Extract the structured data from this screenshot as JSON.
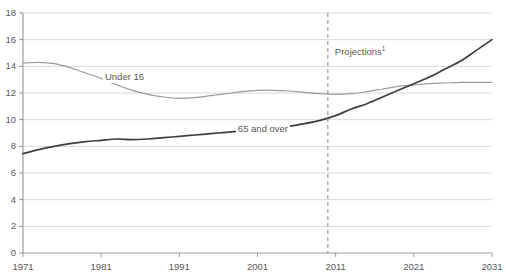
{
  "chart_data": {
    "type": "line",
    "title": "",
    "subtitle": "",
    "xlabel": "",
    "ylabel": "",
    "units": "Millions",
    "xlim": [
      1971,
      2031
    ],
    "ylim": [
      0,
      18
    ],
    "grid": true,
    "grid_axis": "y",
    "legend": "inline-labels",
    "y_ticks": [
      0,
      2,
      4,
      6,
      8,
      10,
      12,
      14,
      16,
      18
    ],
    "y_tick_labels": [
      "0",
      "2",
      "4",
      "6",
      "8",
      "10",
      "12",
      "14",
      "16",
      "18"
    ],
    "x_ticks": [
      1971,
      1981,
      1991,
      2001,
      2011,
      2021,
      2031
    ],
    "x_tick_labels": [
      "1971",
      "1981",
      "1991",
      "2001",
      "2011",
      "2021",
      "2031"
    ],
    "annotations": [
      {
        "name": "projections-divider",
        "label": "Projections",
        "superscript": "1",
        "x": 2010,
        "style": "dashed-vertical-line"
      }
    ],
    "series": [
      {
        "name": "Under 16",
        "color": "#9a9a9a",
        "label_x": 1982,
        "label_y": 13.1,
        "x": [
          1971,
          1973,
          1975,
          1977,
          1979,
          1981,
          1983,
          1985,
          1987,
          1989,
          1991,
          1993,
          1995,
          1997,
          1999,
          2001,
          2003,
          2005,
          2007,
          2009,
          2011,
          2013,
          2015,
          2017,
          2019,
          2021,
          2023,
          2025,
          2027,
          2029,
          2031
        ],
        "values": [
          14.25,
          14.3,
          14.2,
          13.9,
          13.5,
          13.1,
          12.6,
          12.2,
          11.9,
          11.7,
          11.6,
          11.65,
          11.8,
          11.95,
          12.1,
          12.2,
          12.2,
          12.15,
          12.05,
          11.95,
          11.9,
          11.95,
          12.1,
          12.3,
          12.5,
          12.6,
          12.7,
          12.75,
          12.8,
          12.8,
          12.8
        ]
      },
      {
        "name": "65 and over",
        "color": "#3f3f3f",
        "label_x": 1999,
        "label_y": 9.2,
        "x": [
          1971,
          1973,
          1975,
          1977,
          1979,
          1981,
          1983,
          1985,
          1987,
          1989,
          1991,
          1993,
          1995,
          1997,
          1999,
          2001,
          2003,
          2005,
          2007,
          2009,
          2011,
          2013,
          2015,
          2017,
          2019,
          2021,
          2023,
          2025,
          2027,
          2029,
          2031
        ],
        "values": [
          7.45,
          7.75,
          8.0,
          8.2,
          8.35,
          8.45,
          8.55,
          8.5,
          8.55,
          8.65,
          8.75,
          8.85,
          8.95,
          9.05,
          9.15,
          9.25,
          9.35,
          9.5,
          9.7,
          9.95,
          10.3,
          10.8,
          11.2,
          11.7,
          12.2,
          12.7,
          13.2,
          13.8,
          14.4,
          15.2,
          16.0
        ]
      }
    ]
  },
  "plot_geometry": {
    "left": 23,
    "right": 492,
    "top": 13,
    "bottom": 253
  }
}
